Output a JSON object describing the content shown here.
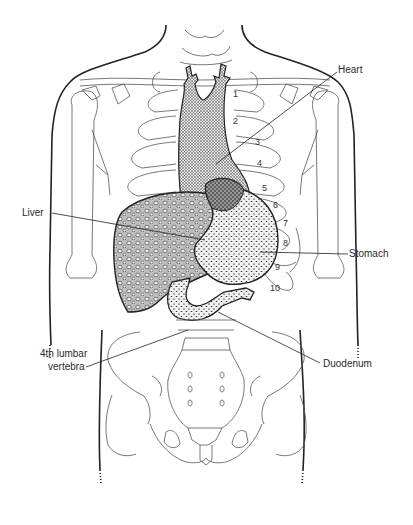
{
  "diagram": {
    "labels": {
      "heart": "Heart",
      "liver": "Liver",
      "stomach": "Stomach",
      "lumbar_line1": "4th lumbar",
      "lumbar_line2": "vertebra",
      "duodenum": "Duodenum"
    },
    "rib_numbers": [
      "1",
      "2",
      "3",
      "4",
      "5",
      "6",
      "7",
      "8",
      "9",
      "10"
    ],
    "colors": {
      "outline": "#222222",
      "bone": "#555555",
      "organ_fill": "#d9d9d9",
      "background": "#ffffff"
    }
  }
}
